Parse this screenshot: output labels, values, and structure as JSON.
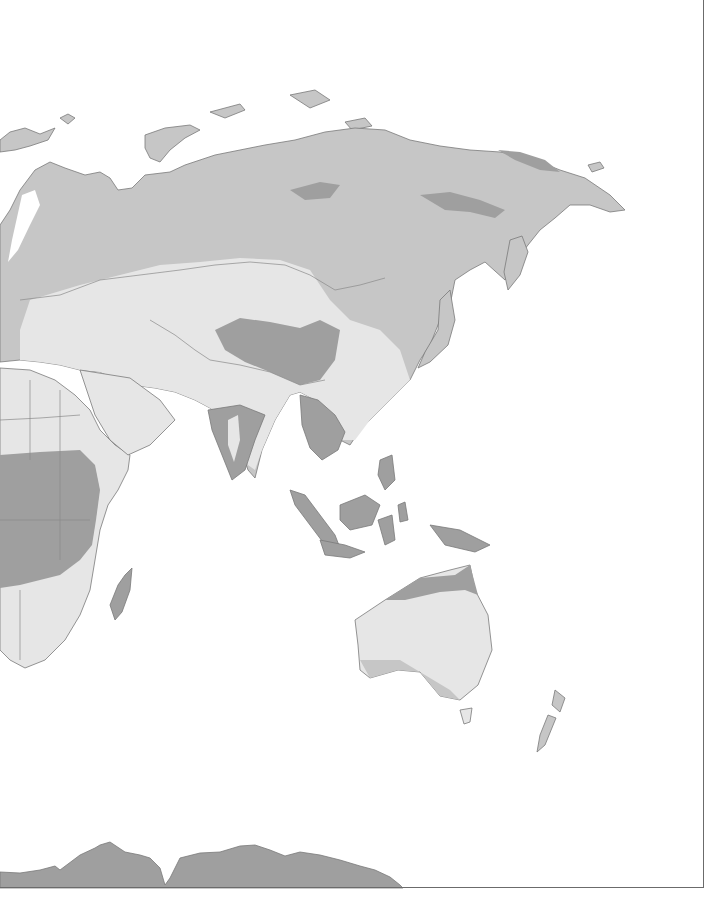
{
  "map": {
    "type": "world-region-thematic-map",
    "view": "Eurasia, Africa, Australia, Antarctica (partial)",
    "legend_visible": false,
    "labels_visible": false,
    "colors": {
      "background": "#ffffff",
      "light": "#e6e6e6",
      "medium": "#c6c6c6",
      "dark": "#9f9f9f",
      "coastline": "#7a7a7a",
      "frame": "#6b6b6b"
    },
    "regions": [
      {
        "name": "Northern Eurasia (Russia, Scandinavia)",
        "shade": "medium"
      },
      {
        "name": "Central Asia steppe",
        "shade": "light"
      },
      {
        "name": "Tibetan Plateau",
        "shade": "dark"
      },
      {
        "name": "Siberian interior bands",
        "shade": "dark"
      },
      {
        "name": "Middle East and North Africa",
        "shade": "light"
      },
      {
        "name": "Central Africa",
        "shade": "dark"
      },
      {
        "name": "Southern Africa",
        "shade": "light"
      },
      {
        "name": "Madagascar",
        "shade": "dark"
      },
      {
        "name": "India",
        "shade": "dark"
      },
      {
        "name": "Southeast Asia",
        "shade": "dark"
      },
      {
        "name": "Maritime Southeast Asia",
        "shade": "dark"
      },
      {
        "name": "China east",
        "shade": "light"
      },
      {
        "name": "Japan",
        "shade": "medium"
      },
      {
        "name": "Australia interior",
        "shade": "light"
      },
      {
        "name": "Northern Australia",
        "shade": "dark"
      },
      {
        "name": "New Zealand",
        "shade": "medium"
      },
      {
        "name": "Antarctica",
        "shade": "dark"
      }
    ]
  }
}
